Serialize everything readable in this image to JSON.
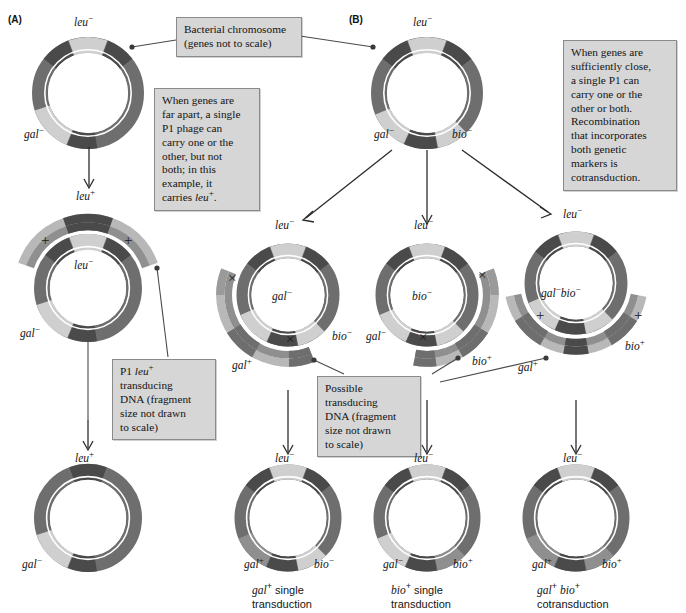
{
  "figure": {
    "panels": [
      {
        "id": "A",
        "label": "(A)"
      },
      {
        "id": "B",
        "label": "(B)"
      }
    ]
  },
  "colors": {
    "dark_ring": "#6e6e6e",
    "mid_ring": "#8f8f8f",
    "light_gene": "#cfcfcf",
    "darker_gene": "#4a4a4a",
    "fragment_light": "#b8b8b8",
    "fragment_dark": "#6e6e6e",
    "callout_bg": "#d6d6d6",
    "callout_border": "#8a8a8a",
    "line": "#4a4a4a",
    "page_bg": "#ffffff",
    "text": "#141414"
  },
  "callouts": [
    {
      "id": "bacterial-chromosome",
      "text": "Bacterial chromosome (genes not to scale)",
      "lines": [
        "Bacterial chromosome",
        "(genes not to scale)"
      ]
    },
    {
      "id": "far-apart",
      "text": "When genes are far apart, a single P1 phage can carry one or the other, but not both; in this example, it carries leu+.",
      "lines": [
        "When genes are",
        "far apart, a single",
        "P1 phage can",
        "carry one or the",
        "other, but not",
        "both; in this",
        "example, it",
        "carries leu+."
      ]
    },
    {
      "id": "sufficiently-close",
      "text": "When genes are sufficiently close, a single P1 can carry one or the other or both. Recombination that incorporates both genetic markers is cotransduction.",
      "lines": [
        "When genes are",
        "sufficiently close,",
        "a single P1 can",
        "carry one or the",
        "other or both.",
        "Recombination",
        "that incorporates",
        "both genetic",
        "markers is",
        "cotransduction."
      ]
    },
    {
      "id": "p1-leu-transducing-dna",
      "text": "P1 leu+ transducing DNA (fragment size not drawn to scale)",
      "lines": [
        "P1 leu+",
        "transducing",
        "DNA (fragment",
        "size not drawn",
        "to scale)"
      ]
    },
    {
      "id": "possible-transducing-dna",
      "text": "Possible transducing DNA (fragment size not drawn to scale)",
      "lines": [
        "Possible",
        "transducing",
        "DNA (fragment",
        "size not drawn",
        "to scale)"
      ]
    }
  ],
  "panel_a": {
    "label": "(A)",
    "donor_circle": {
      "name": "donor-chromosome-a",
      "gene_labels": [
        {
          "gene": "leu",
          "charge": "−",
          "position": "top"
        },
        {
          "gene": "gal",
          "charge": "−",
          "position": "bottom-left"
        }
      ]
    },
    "recipient_circle": {
      "name": "recipient-chromosome-a",
      "top_label": {
        "gene": "leu",
        "charge": "+"
      },
      "gene_labels": [
        {
          "gene": "leu",
          "charge": "−",
          "position": "center"
        },
        {
          "gene": "gal",
          "charge": "−",
          "position": "bottom-left"
        }
      ],
      "crossovers": [
        "+",
        "+"
      ]
    },
    "product_circle": {
      "name": "transductant-chromosome-a",
      "top_label": {
        "gene": "leu",
        "charge": "+"
      },
      "gene_labels": [
        {
          "gene": "gal",
          "charge": "−",
          "position": "bottom-left"
        }
      ]
    }
  },
  "panel_b": {
    "label": "(B)",
    "donor_circle": {
      "name": "donor-chromosome-b",
      "gene_labels": [
        {
          "gene": "leu",
          "charge": "−",
          "position": "top"
        },
        {
          "gene": "gal",
          "charge": "−",
          "position": "bottom-left"
        },
        {
          "gene": "bio",
          "charge": "−",
          "position": "bottom-right"
        }
      ]
    },
    "recombination_events": [
      {
        "name": "gal-plus-recombination",
        "top_label": {
          "gene": "leu",
          "charge": "−"
        },
        "center_label": {
          "gene": "gal",
          "charge": "−"
        },
        "right_label": {
          "gene": "bio",
          "charge": "−"
        },
        "fragment_label": {
          "gene": "gal",
          "charge": "+"
        },
        "crossovers": [
          "×",
          "×"
        ]
      },
      {
        "name": "bio-plus-recombination",
        "top_label": {
          "gene": "leu",
          "charge": "−"
        },
        "center_label": {
          "gene": "bio",
          "charge": "−"
        },
        "left_label": {
          "gene": "gal",
          "charge": "−"
        },
        "fragment_label": {
          "gene": "bio",
          "charge": "+"
        },
        "crossovers": [
          "×",
          "×"
        ]
      },
      {
        "name": "cotransduction-recombination",
        "top_label": {
          "gene": "leu",
          "charge": "−"
        },
        "center_label": {
          "gene": "gal",
          "charge": "−",
          "gene2": "bio",
          "charge2": "−"
        },
        "fragment_label_left": {
          "gene": "gal",
          "charge": "+"
        },
        "fragment_label_right": {
          "gene": "bio",
          "charge": "+"
        },
        "crossovers": [
          "+",
          "×"
        ]
      }
    ],
    "products": [
      {
        "name": "gal-plus-transductant",
        "top_label": {
          "gene": "leu",
          "charge": "−"
        },
        "gene_labels": [
          {
            "gene": "gal",
            "charge": "+",
            "position": "bottom-left"
          },
          {
            "gene": "bio",
            "charge": "−",
            "position": "bottom-right"
          }
        ],
        "caption_lines": [
          "gal+ single",
          "transduction"
        ],
        "caption_gene": "gal",
        "caption_charge": "+",
        "caption_rest": " single",
        "caption_second_line": "transduction"
      },
      {
        "name": "bio-plus-transductant",
        "top_label": {
          "gene": "leu",
          "charge": "−"
        },
        "gene_labels": [
          {
            "gene": "gal",
            "charge": "−",
            "position": "bottom-left"
          },
          {
            "gene": "bio",
            "charge": "+",
            "position": "bottom-right"
          }
        ],
        "caption_lines": [
          "bio+ single",
          "transduction"
        ],
        "caption_gene": "bio",
        "caption_charge": "+",
        "caption_rest": " single",
        "caption_second_line": "transduction"
      },
      {
        "name": "cotransductant",
        "top_label": {
          "gene": "leu",
          "charge": "−"
        },
        "gene_labels": [
          {
            "gene": "gal",
            "charge": "+",
            "position": "bottom-left"
          },
          {
            "gene": "bio",
            "charge": "+",
            "position": "bottom-right"
          }
        ],
        "caption_lines": [
          "gal+ bio+",
          "cotransduction"
        ],
        "caption_gene": "gal",
        "caption_charge": "+",
        "caption_gene2": "bio",
        "caption_charge2": "+",
        "caption_second_line": "cotransduction"
      }
    ]
  },
  "gene_text": {
    "leu": "leu",
    "gal": "gal",
    "bio": "bio",
    "minus": "−",
    "plus": "+",
    "cross": "×"
  }
}
